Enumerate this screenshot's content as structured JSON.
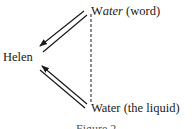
{
  "diagram": {
    "nodes": {
      "word": {
        "prefix": "W",
        "italic": "ater",
        "suffix": " (word)"
      },
      "helen": {
        "label": "Helen"
      },
      "liquid": {
        "label": "Water (the liquid)"
      }
    },
    "edges": [
      {
        "from": "word",
        "to": "helen",
        "style": "double-line arrow"
      },
      {
        "from": "liquid",
        "to": "helen",
        "style": "double-line arrow"
      },
      {
        "from": "word",
        "to": "liquid",
        "style": "dashed"
      }
    ],
    "caption": "Figure 2"
  }
}
